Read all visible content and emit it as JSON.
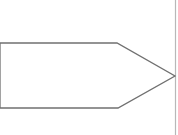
{
  "diagram": {
    "width": 178,
    "height": 135,
    "background": "#ffffff",
    "shapes": [
      {
        "type": "pentagon-arrow",
        "direction": "right",
        "points": "0,43 117,43 175,76 118,108 0,108",
        "stroke": "#707070",
        "stroke_width": 1.3,
        "fill": "#ffffff",
        "label": ""
      },
      {
        "type": "vertical-line",
        "x": 175.5,
        "y1": 0,
        "y2": 135,
        "stroke": "#b8b8b8",
        "stroke_width": 1.2
      }
    ]
  }
}
